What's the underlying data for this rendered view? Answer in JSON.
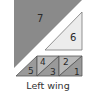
{
  "diagram": {
    "caption": "Left wing",
    "pieces": [
      {
        "id": "1",
        "label": "1",
        "shade": "medium"
      },
      {
        "id": "2",
        "label": "2",
        "shade": "light-medium"
      },
      {
        "id": "3",
        "label": "3",
        "shade": "medium"
      },
      {
        "id": "4",
        "label": "4",
        "shade": "light-medium"
      },
      {
        "id": "5",
        "label": "5",
        "shade": "medium"
      },
      {
        "id": "6",
        "label": "6",
        "shade": "light"
      },
      {
        "id": "7",
        "label": "7",
        "shade": "dark"
      }
    ],
    "colors": {
      "dark": "#8a8a8a",
      "light": "#ececec",
      "medium": "#9a9a9a",
      "light_medium": "#b9b9b9",
      "outline": "#555555",
      "background": "#ffffff"
    }
  }
}
